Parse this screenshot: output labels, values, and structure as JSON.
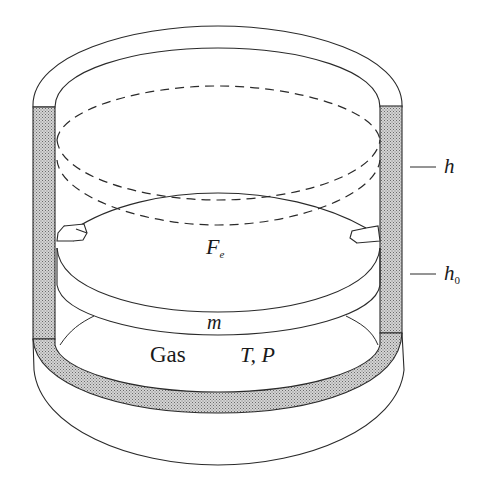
{
  "diagram": {
    "labels": {
      "h": "h",
      "h0_main": "h",
      "h0_sub": "0",
      "fe_main": "F",
      "fe_sub": "e",
      "m": "m",
      "gas": "Gas",
      "tp": "T, P"
    },
    "colors": {
      "stroke": "#2a2a2a",
      "wall_fill": "#b8b8b8",
      "background": "#ffffff"
    }
  }
}
